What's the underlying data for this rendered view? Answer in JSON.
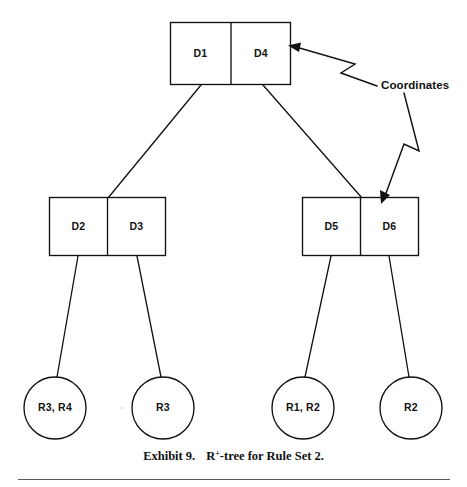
{
  "figure": {
    "caption_number": "Exhibit 9.",
    "caption_title": "R",
    "caption_superscript": "+",
    "caption_title_rest": "-tree for Rule Set 2."
  },
  "annotation": {
    "label": "Coordinates"
  },
  "tree": {
    "root": {
      "name": "root-node",
      "cells": [
        {
          "label": "D1"
        },
        {
          "label": "D4"
        }
      ]
    },
    "internal": [
      {
        "name": "internal-node-left",
        "cells": [
          {
            "label": "D2"
          },
          {
            "label": "D3"
          }
        ]
      },
      {
        "name": "internal-node-right",
        "cells": [
          {
            "label": "D5"
          },
          {
            "label": "D6"
          }
        ]
      }
    ],
    "leaves": [
      {
        "label": "R3, R4"
      },
      {
        "label": "R3"
      },
      {
        "label": "R1, R2"
      },
      {
        "label": "R2"
      }
    ]
  },
  "colors": {
    "stroke": "#111111",
    "background": "#ffffff",
    "rule": "#5a5a5a"
  }
}
